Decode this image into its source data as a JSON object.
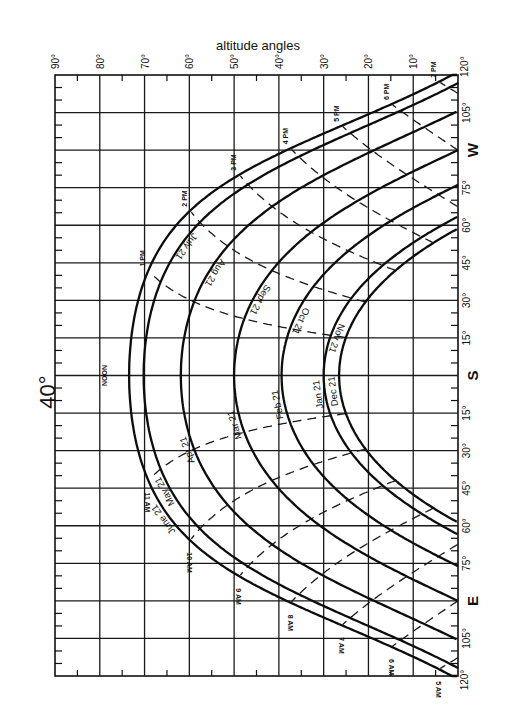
{
  "chart_data": {
    "type": "line",
    "title": "40°",
    "subtitle": "",
    "xlabel": "altitude angles",
    "ylabel": "bearing angles",
    "latitude": 40,
    "orientation": "rotated 90° — altitude runs along top axis (90° left to 0° right); bearing runs along right axis (W at top, S center, E at bottom)",
    "altitude_ticks": [
      "90°",
      "80°",
      "70°",
      "60°",
      "50°",
      "40°",
      "30°",
      "20°",
      "10°"
    ],
    "altitude_tick_values": [
      90,
      80,
      70,
      60,
      50,
      40,
      30,
      20,
      10
    ],
    "xlim": [
      90,
      0
    ],
    "bearing_ticks": [
      {
        "label": "120°",
        "value": 120
      },
      {
        "label": "105°",
        "value": 105
      },
      {
        "label": "W",
        "value": 90
      },
      {
        "label": "75°",
        "value": 75
      },
      {
        "label": "60°",
        "value": 60
      },
      {
        "label": "45°",
        "value": 45
      },
      {
        "label": "30°",
        "value": 30
      },
      {
        "label": "15°",
        "value": 15
      },
      {
        "label": "S",
        "value": 0
      },
      {
        "label": "15°",
        "value": -15
      },
      {
        "label": "30°",
        "value": -30
      },
      {
        "label": "45°",
        "value": -45
      },
      {
        "label": "60°",
        "value": -60
      },
      {
        "label": "75°",
        "value": -75
      },
      {
        "label": "E",
        "value": -90
      },
      {
        "label": "105°",
        "value": -105
      },
      {
        "label": "120°",
        "value": -120
      }
    ],
    "ylim": [
      120,
      -120
    ],
    "grid": true,
    "legend": "none (curves labeled inline)",
    "series": [
      {
        "name": "June 21",
        "declination": 23.45,
        "noon_altitude": 73.5,
        "label_side": "east"
      },
      {
        "name": "May 21",
        "declination": 20.1,
        "noon_altitude": 70.1,
        "label_side": "east",
        "paired_with": "July 21"
      },
      {
        "name": "July 21",
        "declination": 20.4,
        "noon_altitude": 70.4,
        "label_side": "west"
      },
      {
        "name": "Apr 21",
        "declination": 11.9,
        "noon_altitude": 61.9,
        "label_side": "east",
        "paired_with": "Aug 21"
      },
      {
        "name": "Aug 21",
        "declination": 12.0,
        "noon_altitude": 62.0,
        "label_side": "west"
      },
      {
        "name": "Mar 21",
        "declination": 0.0,
        "noon_altitude": 50.0,
        "label_side": "east",
        "paired_with": "Sept 21"
      },
      {
        "name": "Sept 21",
        "declination": 0.0,
        "noon_altitude": 50.0,
        "label_side": "west"
      },
      {
        "name": "Feb 21",
        "declination": -10.6,
        "noon_altitude": 39.4,
        "label_side": "east",
        "paired_with": "Oct 21"
      },
      {
        "name": "Oct 21",
        "declination": -10.7,
        "noon_altitude": 39.3,
        "label_side": "west"
      },
      {
        "name": "Jan 21",
        "declination": -20.0,
        "noon_altitude": 30.0,
        "label_side": "east",
        "paired_with": "Nov 21"
      },
      {
        "name": "Nov 21",
        "declination": -19.9,
        "noon_altitude": 30.1,
        "label_side": "west"
      },
      {
        "name": "Dec 21",
        "declination": -23.45,
        "noon_altitude": 26.6,
        "label_side": "east"
      }
    ],
    "drawn_curves": [
      {
        "labels": [
          "June 21"
        ],
        "declination": 23.45
      },
      {
        "labels": [
          "May 21",
          "July 21"
        ],
        "declination": 20.2
      },
      {
        "labels": [
          "Apr 21",
          "Aug 21"
        ],
        "declination": 11.9
      },
      {
        "labels": [
          "Mar 21",
          "Sept 21"
        ],
        "declination": 0.0
      },
      {
        "labels": [
          "Feb 21",
          "Oct 21"
        ],
        "declination": -10.6
      },
      {
        "labels": [
          "Jan 21",
          "Nov 21"
        ],
        "declination": -20.0
      },
      {
        "labels": [
          "Dec 21"
        ],
        "declination": -23.45
      }
    ],
    "hour_lines": [
      {
        "label": "5 AM",
        "hour": -7
      },
      {
        "label": "6 AM",
        "hour": -6
      },
      {
        "label": "7 AM",
        "hour": -5
      },
      {
        "label": "8 AM",
        "hour": -4
      },
      {
        "label": "9 AM",
        "hour": -3
      },
      {
        "label": "10 AM",
        "hour": -2
      },
      {
        "label": "11 AM",
        "hour": -1
      },
      {
        "label": "NOON",
        "hour": 0
      },
      {
        "label": "1 PM",
        "hour": 1
      },
      {
        "label": "2 PM",
        "hour": 2
      },
      {
        "label": "3 PM",
        "hour": 3
      },
      {
        "label": "4 PM",
        "hour": 4
      },
      {
        "label": "5 PM",
        "hour": 5
      },
      {
        "label": "6 PM",
        "hour": 6
      },
      {
        "label": "7 PM",
        "hour": 7
      }
    ]
  },
  "labels": {
    "title": "40°",
    "altitude_axis_title": "altitude angles"
  },
  "layout": {
    "plot_left": 55,
    "plot_right": 458,
    "plot_top": 75,
    "plot_bottom": 676,
    "colors": {
      "ink": "#111111",
      "paper": "#ffffff"
    }
  }
}
